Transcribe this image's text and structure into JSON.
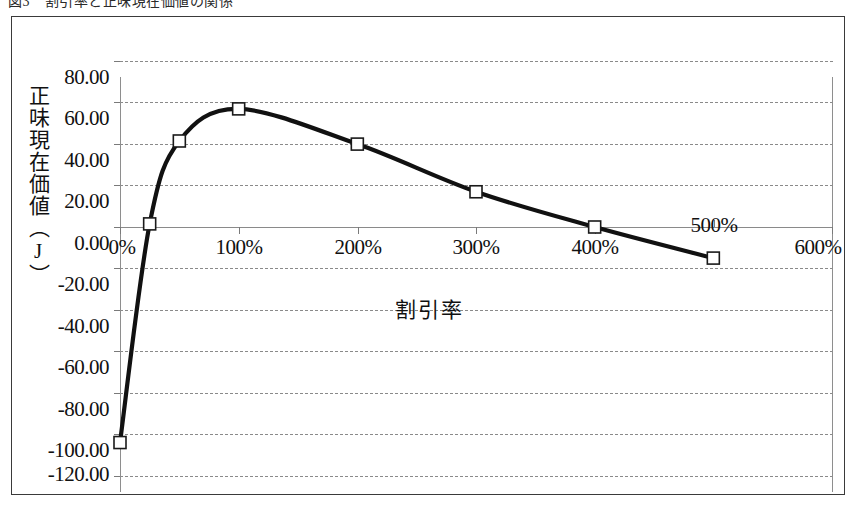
{
  "caption": {
    "text": "図3　割引率と正味現在価値の関係"
  },
  "axes": {
    "y_title": "正味現在価値（J）",
    "x_title": "割引率",
    "y_ticks": [
      "80.00",
      "60.00",
      "40.00",
      "20.00",
      "0.00",
      "-20.00",
      "-40.00",
      "-60.00",
      "-80.00",
      "-100.00",
      "-120.00"
    ],
    "x_ticks": [
      "0%",
      "100%",
      "200%",
      "300%",
      "400%",
      "500%",
      "600%"
    ]
  },
  "chart_data": {
    "type": "line",
    "title": "図3　割引率と正味現在価値の関係",
    "xlabel": "割引率",
    "ylabel": "正味現在価値（J）",
    "xlim": [
      0,
      600
    ],
    "ylim": [
      -120,
      80
    ],
    "ytick_values": [
      80,
      60,
      40,
      20,
      0,
      -20,
      -40,
      -60,
      -80,
      -100,
      -120
    ],
    "ytick_labels": [
      "80.00",
      "60.00",
      "40.00",
      "20.00",
      "0.00",
      "-20.00",
      "-40.00",
      "-60.00",
      "-80.00",
      "-100.00",
      "-120.00"
    ],
    "xtick_values": [
      0,
      100,
      200,
      300,
      400,
      500,
      600
    ],
    "xtick_labels": [
      "0%",
      "100%",
      "200%",
      "300%",
      "400%",
      "500%",
      "600%"
    ],
    "x_unit": "percent",
    "grid": true,
    "grid_style": "dashed horizontal",
    "legend": false,
    "marker": "open-square",
    "line_color": "#111111",
    "marker_fill": "#ffffff",
    "series": [
      {
        "name": "正味現在価値",
        "x": [
          0,
          25,
          50,
          100,
          200,
          300,
          400,
          500
        ],
        "values": [
          -104.0,
          1.5,
          41.5,
          57.0,
          40.0,
          17.0,
          0.0,
          -15.0
        ]
      }
    ],
    "annotations": []
  }
}
